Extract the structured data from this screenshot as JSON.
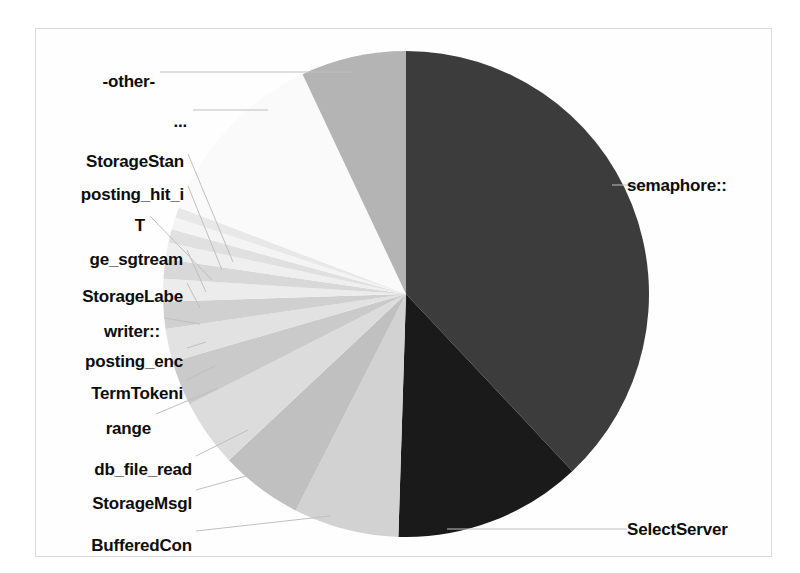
{
  "figure": {
    "background_color": "#ffffff",
    "frame_color": "#d9d9d9",
    "label_color": "#0d0d0d",
    "leader_color": "#bfbfbf"
  },
  "chart_data": {
    "type": "pie",
    "title": "",
    "subtitle": "",
    "xlabel": "",
    "ylabel": "",
    "legend_position": "none",
    "grid": false,
    "start_angle_deg": 90,
    "direction": "clockwise",
    "center": [
      406,
      294
    ],
    "radius": 243,
    "labels": [
      "semaphore::",
      "SelectServer",
      "BufferedCon",
      "StorageMsgl",
      "db_file_read",
      "range",
      "TermTokeni",
      "posting_enc",
      "writer::",
      "StorageLabe",
      "ge_sgtream",
      "T",
      "posting_hit_i",
      "StorageStan",
      "...",
      "-other-"
    ],
    "values": [
      38.0,
      12.5,
      7.0,
      5.5,
      4.5,
      3.0,
      2.2,
      1.8,
      1.5,
      1.3,
      1.1,
      0.9,
      0.8,
      0.7,
      12.2,
      7.0
    ],
    "colors": [
      "#3c3c3c",
      "#1a1a1a",
      "#d2d2d2",
      "#c0c0c0",
      "#dcdcdc",
      "#cacaca",
      "#e2e2e2",
      "#d0d0d0",
      "#ececec",
      "#d8d8d8",
      "#efefef",
      "#e0e0e0",
      "#f4f4f4",
      "#e8e8e8",
      "#fafafa",
      "#b4b4b4"
    ],
    "slice_labels": [
      {
        "text": "semaphore::",
        "side": "right",
        "x": 627,
        "y": 177,
        "leader": [
          [
            612,
            185
          ],
          [
            668,
            185
          ]
        ]
      },
      {
        "text": "SelectServer",
        "side": "right",
        "x": 627,
        "y": 521,
        "leader": [
          [
            447,
            529
          ],
          [
            627,
            529
          ]
        ]
      },
      {
        "text": "BufferedCon",
        "side": "left",
        "x": 192,
        "y": 537,
        "leader": [
          [
            196,
            531
          ],
          [
            330,
            516
          ]
        ]
      },
      {
        "text": "StorageMsgl",
        "side": "left",
        "x": 192,
        "y": 495,
        "leader": [
          [
            196,
            490
          ],
          [
            282,
            466
          ]
        ]
      },
      {
        "text": "db_file_read",
        "side": "left",
        "x": 192,
        "y": 461,
        "leader": [
          [
            196,
            456
          ],
          [
            248,
            430
          ]
        ]
      },
      {
        "text": "range",
        "side": "left",
        "x": 151,
        "y": 420,
        "leader": [
          [
            156,
            414
          ],
          [
            218,
            388
          ]
        ]
      },
      {
        "text": "TermTokeni",
        "side": "left",
        "x": 183,
        "y": 385,
        "leader": [
          [
            187,
            380
          ],
          [
            215,
            366
          ]
        ]
      },
      {
        "text": "posting_enc",
        "side": "left",
        "x": 183,
        "y": 353,
        "leader": [
          [
            187,
            348
          ],
          [
            206,
            342
          ]
        ]
      },
      {
        "text": "writer::",
        "side": "left",
        "x": 160,
        "y": 323,
        "leader": [
          [
            164,
            318
          ],
          [
            200,
            324
          ]
        ]
      },
      {
        "text": "StorageLabe",
        "side": "left",
        "x": 183,
        "y": 288,
        "leader": [
          [
            187,
            283
          ],
          [
            200,
            308
          ]
        ]
      },
      {
        "text": "ge_sgtream",
        "side": "left",
        "x": 183,
        "y": 251,
        "leader": [
          [
            187,
            250
          ],
          [
            206,
            292
          ]
        ]
      },
      {
        "text": "T",
        "side": "left",
        "x": 145,
        "y": 217,
        "leader": [
          [
            150,
            216
          ],
          [
            212,
            280
          ]
        ]
      },
      {
        "text": "posting_hit_i",
        "side": "left",
        "x": 184,
        "y": 186,
        "leader": [
          [
            188,
            186
          ],
          [
            222,
            270
          ]
        ]
      },
      {
        "text": "StorageStan",
        "side": "left",
        "x": 184,
        "y": 153,
        "leader": [
          [
            188,
            154
          ],
          [
            233,
            262
          ]
        ]
      },
      {
        "text": "...",
        "side": "left",
        "x": 187,
        "y": 113,
        "leader": [
          [
            193,
            110
          ],
          [
            268,
            110
          ]
        ]
      },
      {
        "text": "-other-",
        "side": "left",
        "x": 155,
        "y": 73,
        "leader": [
          [
            160,
            72
          ],
          [
            352,
            72
          ]
        ]
      }
    ]
  }
}
